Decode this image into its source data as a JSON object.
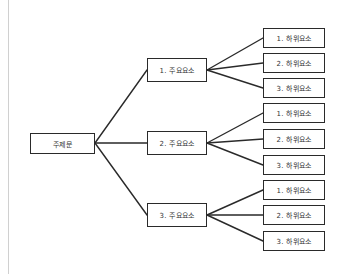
{
  "diagram": {
    "type": "tree",
    "root": {
      "label": "주제문"
    },
    "children": [
      {
        "label": "1. 주요요소",
        "children": [
          {
            "label": "1. 하위요소"
          },
          {
            "label": "2. 하위요소"
          },
          {
            "label": "3. 하위요소"
          }
        ]
      },
      {
        "label": "2. 주요요소",
        "children": [
          {
            "label": "1. 하위요소"
          },
          {
            "label": "2. 하위요소"
          },
          {
            "label": "3. 하위요소"
          }
        ]
      },
      {
        "label": "3. 주요요소",
        "children": [
          {
            "label": "1. 하위요소"
          },
          {
            "label": "2. 하위요소"
          },
          {
            "label": "3. 하위요소"
          }
        ]
      }
    ],
    "colors": {
      "stroke": "#2a2a2a",
      "background": "#ffffff"
    }
  }
}
